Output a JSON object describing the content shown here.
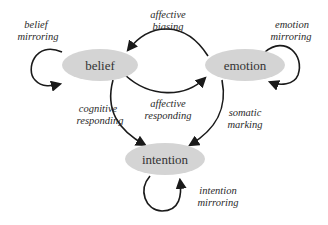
{
  "diagram": {
    "type": "state-transition",
    "nodes": {
      "belief": {
        "label": "belief"
      },
      "emotion": {
        "label": "emotion"
      },
      "intention": {
        "label": "intention"
      }
    },
    "edges": {
      "belief_mirroring": {
        "line1": "belief",
        "line2": "mirroring",
        "from": "belief",
        "to": "belief"
      },
      "emotion_mirroring": {
        "line1": "emotion",
        "line2": "mirroring",
        "from": "emotion",
        "to": "emotion"
      },
      "intention_mirroring": {
        "line1": "intention",
        "line2": "mirroring",
        "from": "intention",
        "to": "intention"
      },
      "affective_biasing": {
        "line1": "affective",
        "line2": "biasing",
        "from": "emotion",
        "to": "belief"
      },
      "affective_responding": {
        "line1": "affective",
        "line2": "responding",
        "from": "belief",
        "to": "emotion"
      },
      "cognitive_responding": {
        "line1": "cognitive",
        "line2": "responding",
        "from": "belief",
        "to": "intention"
      },
      "somatic_marking": {
        "line1": "somatic",
        "line2": "marking",
        "from": "emotion",
        "to": "intention"
      }
    },
    "colors": {
      "node_fill": "#d4d4d4",
      "edge_stroke": "#1a1a1a",
      "text": "#333333"
    }
  }
}
